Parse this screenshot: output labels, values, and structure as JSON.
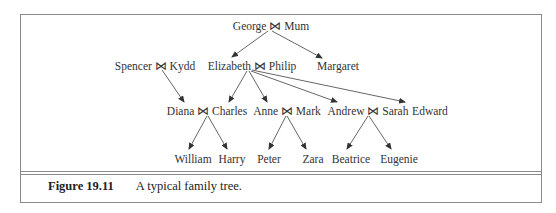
{
  "figure": {
    "label": "Figure 19.11",
    "caption": "A typical family tree."
  },
  "tree": {
    "join_symbol": "⋈",
    "nodes": {
      "george_mum": "George ⋈ Mum",
      "spencer_kydd": "Spencer ⋈ Kydd",
      "elizabeth_philip": "Elizabeth ⋈ Philip",
      "margaret": "Margaret",
      "diana_charles": "Diana ⋈ Charles",
      "anne_mark": "Anne ⋈ Mark",
      "andrew_sarah": "Andrew ⋈ Sarah",
      "edward": "Edward",
      "william": "William",
      "harry": "Harry",
      "peter": "Peter",
      "zara": "Zara",
      "beatrice": "Beatrice",
      "eugenie": "Eugenie"
    },
    "edges": [
      [
        "George ⋈ Mum",
        "Elizabeth ⋈ Philip"
      ],
      [
        "George ⋈ Mum",
        "Margaret"
      ],
      [
        "Spencer ⋈ Kydd",
        "Diana ⋈ Charles"
      ],
      [
        "Elizabeth ⋈ Philip",
        "Diana ⋈ Charles"
      ],
      [
        "Elizabeth ⋈ Philip",
        "Anne ⋈ Mark"
      ],
      [
        "Elizabeth ⋈ Philip",
        "Andrew ⋈ Sarah"
      ],
      [
        "Elizabeth ⋈ Philip",
        "Edward"
      ],
      [
        "Diana ⋈ Charles",
        "William"
      ],
      [
        "Diana ⋈ Charles",
        "Harry"
      ],
      [
        "Anne ⋈ Mark",
        "Peter"
      ],
      [
        "Anne ⋈ Mark",
        "Zara"
      ],
      [
        "Andrew ⋈ Sarah",
        "Beatrice"
      ],
      [
        "Andrew ⋈ Sarah",
        "Eugenie"
      ]
    ]
  }
}
